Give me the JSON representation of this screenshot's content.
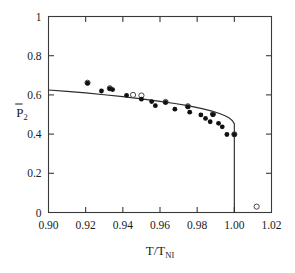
{
  "figure": {
    "background_color": "#ffffff",
    "foreground_color": "#1a1a1a"
  },
  "chart_data": {
    "type": "scatter",
    "title": "",
    "subtitle": "",
    "xlabel": "T/T_NI",
    "xlabel_main": "T/T",
    "xlabel_subscript": "NI",
    "ylabel": "P̅2",
    "ylabel_main": "P",
    "ylabel_subscript": "2",
    "ylabel_has_overbar": true,
    "xlim": [
      0.9,
      1.02
    ],
    "ylim": [
      0.0,
      1.0
    ],
    "xticks": [
      0.9,
      0.92,
      0.94,
      0.96,
      0.98,
      1.0,
      1.02
    ],
    "xtick_labels": [
      "0.90",
      "0.92",
      "0.94",
      "0.96",
      "0.98",
      "1.00",
      "1.02"
    ],
    "yticks": [
      0,
      0.2,
      0.4,
      0.6,
      0.8,
      1
    ],
    "ytick_labels": [
      "0",
      "0.2",
      "0.4",
      "0.6",
      "0.8",
      "1"
    ],
    "grid": false,
    "legend": null,
    "legend_position": "none",
    "frame": "box",
    "tick_direction": "in",
    "series": [
      {
        "name": "theory-curve",
        "type": "line",
        "marker": "none",
        "color": "#2b2b2b",
        "points": [
          [
            0.9,
            0.625
          ],
          [
            0.91,
            0.618
          ],
          [
            0.92,
            0.61
          ],
          [
            0.93,
            0.601
          ],
          [
            0.94,
            0.591
          ],
          [
            0.95,
            0.58
          ],
          [
            0.96,
            0.567
          ],
          [
            0.968,
            0.556
          ],
          [
            0.975,
            0.545
          ],
          [
            0.982,
            0.531
          ],
          [
            0.988,
            0.517
          ],
          [
            0.992,
            0.505
          ],
          [
            0.995,
            0.494
          ],
          [
            0.997,
            0.484
          ],
          [
            0.999,
            0.468
          ],
          [
            1.0,
            0.452
          ],
          [
            1.0,
            0.0
          ]
        ]
      },
      {
        "name": "filled-circles",
        "type": "scatter",
        "marker": "filled-circle",
        "color": "#111111",
        "values": [
          [
            0.921,
            0.66
          ],
          [
            0.9285,
            0.62
          ],
          [
            0.933,
            0.632
          ],
          [
            0.9345,
            0.627
          ],
          [
            0.942,
            0.598
          ],
          [
            0.95,
            0.578
          ],
          [
            0.9555,
            0.566
          ],
          [
            0.9575,
            0.545
          ],
          [
            0.963,
            0.562
          ],
          [
            0.968,
            0.527
          ],
          [
            0.975,
            0.54
          ],
          [
            0.976,
            0.512
          ],
          [
            0.982,
            0.498
          ],
          [
            0.9845,
            0.48
          ],
          [
            0.987,
            0.463
          ],
          [
            0.9885,
            0.5
          ],
          [
            0.9915,
            0.455
          ],
          [
            0.9935,
            0.437
          ],
          [
            0.996,
            0.398
          ],
          [
            1.0,
            0.398
          ]
        ]
      },
      {
        "name": "open-circles",
        "type": "scatter",
        "marker": "open-circle",
        "color": "#ffffff",
        "edge_color": "#333333",
        "values": [
          [
            0.921,
            0.662
          ],
          [
            0.933,
            0.634
          ],
          [
            0.9455,
            0.6
          ],
          [
            0.95,
            0.597
          ],
          [
            0.963,
            0.564
          ],
          [
            0.975,
            0.542
          ],
          [
            0.9885,
            0.502
          ],
          [
            1.0,
            0.399
          ],
          [
            1.012,
            0.03
          ]
        ]
      }
    ],
    "annotations": [
      {
        "text": "first-order discontinuity at T/T_NI = 1.00",
        "x": 1.0,
        "y": 0.0,
        "visible": false
      }
    ]
  }
}
